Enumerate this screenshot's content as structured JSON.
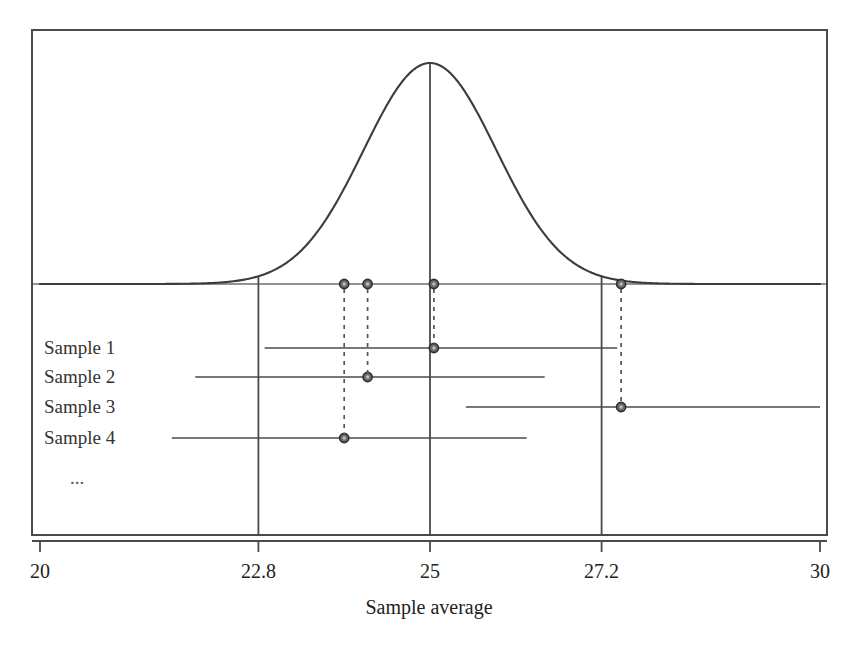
{
  "figure": {
    "axis_title": "Sample average",
    "ellipsis": "..."
  },
  "chart_data": {
    "type": "line",
    "title": "",
    "xlabel": "Sample average",
    "ylabel": "",
    "xlim": [
      20,
      30
    ],
    "grid": false,
    "legend": "none",
    "tick_labels": [
      "20",
      "22.8",
      "25",
      "27.2",
      "30"
    ],
    "ticks": [
      20,
      22.8,
      25,
      27.2,
      30
    ],
    "vertical_reference_lines": [
      22.8,
      25,
      27.2
    ],
    "distribution_curve": {
      "name": "Sampling distribution of the sample average",
      "shape": "normal",
      "mean": 25,
      "sd": 0.85,
      "peak_x": 25
    },
    "series": [
      {
        "name": "Sample 1",
        "label": "Sample 1",
        "estimate": 25.05,
        "ci_low": 22.88,
        "ci_high": 27.4,
        "contains_mean": true
      },
      {
        "name": "Sample 2",
        "label": "Sample 2",
        "estimate": 24.2,
        "ci_low": 21.99,
        "ci_high": 26.47,
        "contains_mean": true
      },
      {
        "name": "Sample 3",
        "label": "Sample 3",
        "estimate": 27.45,
        "ci_low": 25.46,
        "ci_high": 30.0,
        "contains_mean": false
      },
      {
        "name": "Sample 4",
        "label": "Sample 4",
        "estimate": 23.9,
        "ci_low": 21.69,
        "ci_high": 26.24,
        "contains_mean": true
      }
    ]
  },
  "colors": {
    "frame": "#4a4a4a",
    "curve": "#3c3c3c",
    "baseline": "#6e6e6e",
    "reference_line": "#4a4a4a",
    "interval": "#4a4a4a",
    "marker_fill": "#6b6b6b",
    "marker_stroke": "#2f2f2f",
    "dashed": "#555555",
    "text": "#222222"
  }
}
